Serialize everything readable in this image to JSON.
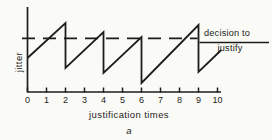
{
  "figure": {
    "ylabel": "jitter",
    "xlabel": "justification times",
    "caption": "a",
    "decision_line1": "decision to",
    "decision_line2": "justify"
  },
  "chart_data": {
    "type": "line",
    "title": "",
    "xlabel": "justification times",
    "ylabel": "jitter",
    "caption": "a",
    "xlim": [
      0,
      10
    ],
    "x_ticks": [
      "0",
      "1",
      "2",
      "3",
      "4",
      "5",
      "6",
      "7",
      "8",
      "9",
      "10"
    ],
    "grid": false,
    "legend": "none",
    "threshold": {
      "value": 0.63,
      "style": "dashed",
      "label": "decision to justify"
    },
    "series": [
      {
        "name": "jitter-sawtooth",
        "points_xy": [
          [
            0,
            0.4
          ],
          [
            2,
            0.812
          ],
          [
            2,
            0.282
          ],
          [
            4,
            0.706
          ],
          [
            4,
            0.224
          ],
          [
            6,
            0.647
          ],
          [
            6,
            0.106
          ],
          [
            9,
            0.788
          ],
          [
            9,
            0.235
          ],
          [
            10.2,
            0.494
          ]
        ]
      }
    ],
    "annotations": [
      "decision to justify"
    ]
  },
  "colors": {
    "ink": "#1d1d1b",
    "paper": "#fafaf7"
  }
}
